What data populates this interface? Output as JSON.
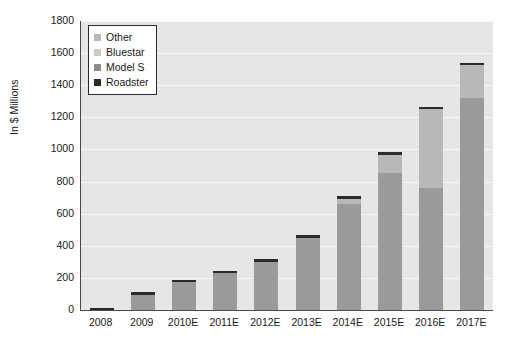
{
  "chart_data": {
    "type": "bar",
    "stacked": true,
    "title": "",
    "subtitle": "",
    "xlabel": "",
    "ylabel": "In $ Millions",
    "ylim": [
      0,
      1800
    ],
    "ytick_step": 200,
    "yticks": [
      "1800",
      "1600",
      "1400",
      "1200",
      "1000",
      "800",
      "600",
      "400",
      "200",
      "0"
    ],
    "grid": true,
    "grid_axis": "y",
    "legend_position": "upper-left-inside",
    "categories": [
      "2008",
      "2009",
      "2010E",
      "2011E",
      "2012E",
      "2013E",
      "2014E",
      "2015E",
      "2016E",
      "2017E"
    ],
    "series": [
      {
        "name": "Model S",
        "color": "#8c8c8c",
        "values": [
          0,
          0,
          0,
          0,
          0,
          0,
          0,
          0,
          0,
          0
        ]
      },
      {
        "name": "Bluestar",
        "color": "#9a9a9a",
        "values": [
          0,
          95,
          175,
          228,
          300,
          450,
          660,
          855,
          760,
          1320
        ]
      },
      {
        "name": "Other",
        "color": "#b8b8b8",
        "values": [
          0,
          0,
          0,
          0,
          0,
          0,
          30,
          110,
          490,
          205
        ]
      },
      {
        "name": "Roadster",
        "color": "#2b2b2b",
        "values": [
          15,
          15,
          15,
          14,
          15,
          15,
          20,
          20,
          15,
          15
        ]
      }
    ],
    "totals": [
      15,
      110,
      190,
      242,
      315,
      465,
      710,
      985,
      1265,
      1540
    ]
  },
  "legend": {
    "items": [
      {
        "label": "Other",
        "color": "#b8b8b8"
      },
      {
        "label": "Bluestar",
        "color": "#c9c9c9"
      },
      {
        "label": "Model S",
        "color": "#8c8c8c"
      },
      {
        "label": "Roadster",
        "color": "#2b2b2b"
      }
    ]
  },
  "colors": {
    "plot_background": "#e6e6e6",
    "gridline": "#f7f7f7",
    "axis": "#4a4a4a",
    "text": "#1a1a1a",
    "page_background": "#ffffff"
  }
}
